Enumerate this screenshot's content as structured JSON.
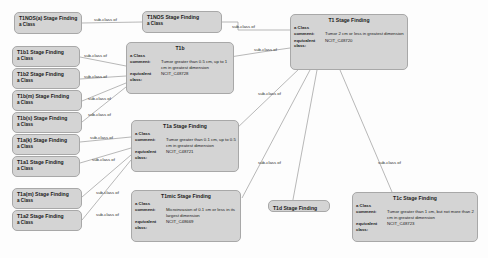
{
  "diagram": {
    "background_color": "#fdfdfd",
    "node_fill": "#d4d4d4",
    "node_border": "#a8a8a8",
    "edge_color": "#9a9a9a",
    "edge_label_text": "sub-class of"
  },
  "labels": {
    "a_class": "a Class",
    "comment": "comment:",
    "equivalent_class_line1": "equivalent",
    "equivalent_class_line2": "class:"
  },
  "nodes": [
    {
      "id": "t1nos_a",
      "title": "T1NOS(a) Stage Finding",
      "subtitle": "a Class",
      "type": "simple"
    },
    {
      "id": "t1nos",
      "title": "T1NOS Stage Finding",
      "subtitle": "a Class",
      "type": "simple"
    },
    {
      "id": "t1b1",
      "title": "T1b1 Stage Finding",
      "subtitle": "a Class",
      "type": "simple"
    },
    {
      "id": "t1b2",
      "title": "T1b2 Stage Finding",
      "subtitle": "a Class",
      "type": "simple"
    },
    {
      "id": "t1bm",
      "title": "T1b(m) Stage Finding",
      "subtitle": "a Class",
      "type": "simple"
    },
    {
      "id": "t1bs",
      "title": "T1b(s) Stage Finding",
      "subtitle": "a Class",
      "type": "simple"
    },
    {
      "id": "t1ak",
      "title": "T1a(k) Stage Finding",
      "subtitle": "a Class",
      "type": "simple"
    },
    {
      "id": "t1a1",
      "title": "T1a1 Stage Finding",
      "subtitle": "a Class",
      "type": "simple"
    },
    {
      "id": "t1am",
      "title": "T1a(m) Stage Finding",
      "subtitle": "a Class",
      "type": "simple"
    },
    {
      "id": "t1a2",
      "title": "T1a2 Stage Finding",
      "subtitle": "a Class",
      "type": "simple"
    },
    {
      "id": "t1d",
      "title": "T1d Stage Finding",
      "subtitle": "",
      "type": "simple"
    },
    {
      "id": "t1",
      "title": "T1 Stage Finding",
      "type": "detail",
      "a_class": "a Class",
      "comment": "Tumor 2 cm or less in greatest dimension",
      "equivalent_class": "NCIT_C48720"
    },
    {
      "id": "t1b",
      "title": "T1b",
      "type": "detail",
      "a_class": "a Class",
      "comment": "Tumor greater than 0.5 cm, up to 1 cm in greatest dimension",
      "equivalent_class": "NCIT_C48728"
    },
    {
      "id": "t1a",
      "title": "T1a Stage Finding",
      "type": "detail",
      "a_class": "a Class",
      "comment": "Tumor greater than 0.1 cm, up to 0.5 cm in greatest dimension",
      "equivalent_class": "NCIT_C48721"
    },
    {
      "id": "t1mic",
      "title": "T1mic Stage Finding",
      "type": "detail",
      "a_class": "a Class",
      "comment": "Microinvasion of 0.1 cm or less in its largest dimension",
      "equivalent_class": "NCIT_C48669"
    },
    {
      "id": "t1c",
      "title": "T1c Stage Finding",
      "type": "detail",
      "a_class": "a Class",
      "comment": "Tumor greater than 1 cm, but not more than 2 cm in greatest dimension",
      "equivalent_class": "NCIT_C48723"
    }
  ],
  "edges": [
    {
      "id": "e1",
      "label": "sub-class of",
      "from": "t1nos_a",
      "to": "t1nos"
    },
    {
      "id": "e2",
      "label": "sub-class of",
      "from": "t1nos",
      "to": "t1"
    },
    {
      "id": "e3",
      "label": "sub-class of",
      "from": "t1b1",
      "to": "t1b"
    },
    {
      "id": "e4",
      "label": "sub-class of",
      "from": "t1b2",
      "to": "t1b"
    },
    {
      "id": "e5",
      "label": "sub-class of",
      "from": "t1bm",
      "to": "t1b"
    },
    {
      "id": "e6",
      "label": "sub-class of",
      "from": "t1bs",
      "to": "t1b"
    },
    {
      "id": "e7",
      "label": "sub-class of",
      "from": "t1b",
      "to": "t1"
    },
    {
      "id": "e8",
      "label": "sub-class of",
      "from": "t1ak",
      "to": "t1a"
    },
    {
      "id": "e9",
      "label": "sub-class of",
      "from": "t1a1",
      "to": "t1a"
    },
    {
      "id": "e10",
      "label": "sub-class of",
      "from": "t1am",
      "to": "t1a"
    },
    {
      "id": "e11",
      "label": "sub-class of",
      "from": "t1a2",
      "to": "t1a"
    },
    {
      "id": "e12",
      "label": "sub-class of",
      "from": "t1a",
      "to": "t1"
    },
    {
      "id": "e13",
      "label": "sub-class of",
      "from": "t1mic",
      "to": "t1"
    },
    {
      "id": "e14",
      "label": "sub-class of",
      "from": "t1d",
      "to": "t1"
    },
    {
      "id": "e15",
      "label": "sub-class of",
      "from": "t1c",
      "to": "t1"
    }
  ]
}
